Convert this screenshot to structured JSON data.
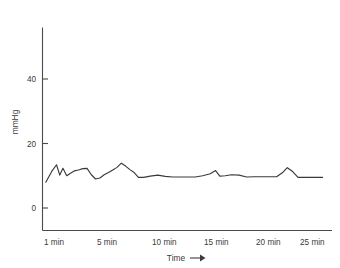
{
  "chart_data": {
    "type": "line",
    "title": "",
    "subtitle": "",
    "xlabel": "Time",
    "xlabel_suffix": "→",
    "ylabel": "mmHg",
    "xlim": [
      0.4,
      27.0
    ],
    "ylim": [
      0,
      56
    ],
    "grid": false,
    "legend": null,
    "y_ticks": [
      0,
      20,
      40
    ],
    "y_tick_labels": [
      "0",
      "20",
      "40"
    ],
    "x_ticks": [
      1,
      5,
      10,
      15,
      20,
      25
    ],
    "x_tick_labels": [
      "1 min",
      "5 min",
      "10 min",
      "15 min",
      "20 min",
      "25 min"
    ],
    "series": [
      {
        "name": "pressure",
        "color": "#3a3a3a",
        "x": [
          0.75,
          1.35,
          1.75,
          2.05,
          2.35,
          2.7,
          3.05,
          3.4,
          3.8,
          4.2,
          4.6,
          5.0,
          5.4,
          5.8,
          6.2,
          6.6,
          7.0,
          7.4,
          7.8,
          8.2,
          8.6,
          9.0,
          9.4,
          9.9,
          10.5,
          11.2,
          11.9,
          12.6,
          13.3,
          14.0,
          14.7,
          15.4,
          16.1,
          16.6,
          17.0,
          17.5,
          18.1,
          18.8,
          19.5,
          20.2,
          20.9,
          21.6,
          22.3,
          22.9,
          23.3,
          23.8,
          24.3,
          25.1,
          26.6
        ],
        "y": [
          8.0,
          11.6,
          13.4,
          10.2,
          12.3,
          10.0,
          10.8,
          11.5,
          11.8,
          12.2,
          12.3,
          10.3,
          9.0,
          9.3,
          10.3,
          11.0,
          11.8,
          12.6,
          13.9,
          13.0,
          11.9,
          11.0,
          9.5,
          9.5,
          9.9,
          10.2,
          9.8,
          9.6,
          9.6,
          9.6,
          9.6,
          10.0,
          10.6,
          11.6,
          9.9,
          10.0,
          10.3,
          10.2,
          9.6,
          9.7,
          9.7,
          9.7,
          9.7,
          11.1,
          12.5,
          11.3,
          9.5,
          9.5,
          9.5
        ]
      }
    ],
    "axis_color": "#4a4a4a",
    "text_color": "#3b3b3b",
    "background": "#ffffff"
  },
  "labels": {
    "y_axis_title": "mmHg",
    "x_axis_title": "Time",
    "x_axis_arrow": "→"
  }
}
